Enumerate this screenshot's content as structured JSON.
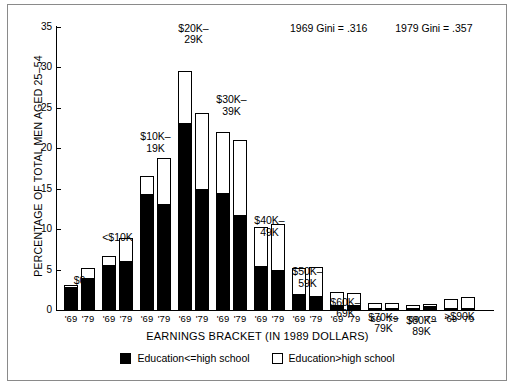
{
  "figure": {
    "y_axis_title": "PERCENTAGE OF TOTAL MEN AGED 25–54",
    "x_axis_title": "EARNINGS BRACKET (IN 1989 DOLLARS)",
    "gini_1969": "1969 Gini = .316",
    "gini_1979": "1979 Gini = .357"
  },
  "legend": {
    "items": [
      {
        "label": "Education<=high school",
        "swatch": "filled",
        "color": "#000000"
      },
      {
        "label": "Education>high school",
        "swatch": "hollow",
        "color": "#ffffff"
      }
    ]
  },
  "y_ticks": [
    {
      "value": 0,
      "label": "0"
    },
    {
      "value": 5,
      "label": "5"
    },
    {
      "value": 10,
      "label": "10"
    },
    {
      "value": 15,
      "label": "15"
    },
    {
      "value": 20,
      "label": "20"
    },
    {
      "value": 25,
      "label": "25"
    },
    {
      "value": 30,
      "label": "30"
    },
    {
      "value": 35,
      "label": "35"
    }
  ],
  "x_tick_labels": [
    "'69",
    "'79"
  ],
  "chart_data": {
    "type": "bar",
    "title": "",
    "subtitle": "",
    "xlabel": "EARNINGS BRACKET (IN 1989 DOLLARS)",
    "ylabel": "PERCENTAGE OF TOTAL MEN AGED 25–54",
    "ylim": [
      0,
      35
    ],
    "ytick_step": 5,
    "grid": false,
    "legend_position": "bottom-center",
    "stacked": true,
    "categories": [
      "$0",
      "<$10K",
      "$10K–19K",
      "$20K–29K",
      "$30K–39K",
      "$40K–49K",
      "$50K–59K",
      "$60K–69K",
      "$70K–79K",
      "$80K–89K",
      ">$90K"
    ],
    "year_labels": [
      "'69",
      "'79"
    ],
    "annotations": [
      "1969 Gini = .316",
      "1979 Gini = .357"
    ],
    "series": [
      {
        "name": "Education<=high school",
        "color": "#000000",
        "values_1969": [
          2.8,
          5.6,
          14.3,
          23.1,
          14.5,
          5.5,
          2.0,
          0.6,
          0.3,
          0.2,
          0.2
        ],
        "values_1979": [
          4.0,
          6.1,
          13.1,
          15.0,
          11.8,
          4.9,
          1.7,
          0.6,
          0.3,
          0.5,
          0.2
        ]
      },
      {
        "name": "Education>high school",
        "color": "#ffffff",
        "values_1969": [
          0.4,
          1.2,
          2.4,
          6.6,
          7.7,
          4.9,
          3.3,
          1.8,
          0.7,
          0.5,
          1.3
        ],
        "values_1979": [
          1.3,
          2.9,
          5.8,
          9.5,
          9.3,
          5.8,
          3.7,
          1.6,
          0.7,
          0.4,
          1.5
        ]
      }
    ],
    "totals_1969": [
      3.2,
      6.8,
      16.7,
      29.7,
      22.2,
      10.4,
      5.3,
      2.4,
      1.0,
      0.7,
      1.5
    ],
    "totals_1979": [
      5.3,
      9.0,
      18.9,
      24.5,
      21.1,
      10.7,
      5.4,
      2.2,
      1.0,
      0.9,
      1.7
    ],
    "bracket_label_offsets_px": [
      {
        "dx": 0,
        "dy": 38
      },
      {
        "dx": 0,
        "dy": 25
      },
      {
        "dx": 0,
        "dy": 4
      },
      {
        "dx": 0,
        "dy": -17
      },
      {
        "dx": 0,
        "dy": -6
      },
      {
        "dx": 0,
        "dy": 22
      },
      {
        "dx": 0,
        "dy": 30
      },
      {
        "dx": 0,
        "dy": 36
      },
      {
        "dx": 0,
        "dy": 40
      },
      {
        "dx": 0,
        "dy": 42
      },
      {
        "dx": 0,
        "dy": 45
      }
    ]
  }
}
